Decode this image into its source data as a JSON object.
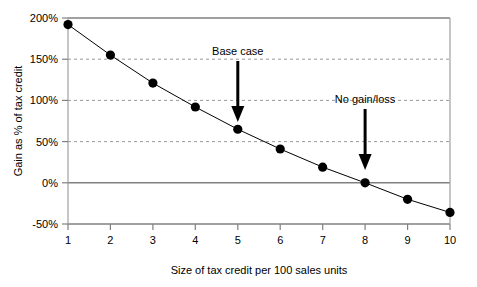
{
  "chart_data": {
    "type": "line",
    "title": "",
    "subtitle": "",
    "xlabel": "Size of tax credit per 100 sales units",
    "ylabel": "Gain as % of tax credit",
    "x": [
      1,
      2,
      3,
      4,
      5,
      6,
      7,
      8,
      9,
      10
    ],
    "values": [
      192,
      155,
      121,
      92,
      65,
      41,
      19,
      0,
      -20,
      -36
    ],
    "series": [
      {
        "name": "Gain as % of tax credit",
        "values": [
          192,
          155,
          121,
          92,
          65,
          41,
          19,
          0,
          -20,
          -36
        ],
        "marker": "filled-circle",
        "color": "#000000"
      }
    ],
    "xlim": [
      1,
      10
    ],
    "ylim": [
      -50,
      200
    ],
    "xticks": [
      1,
      2,
      3,
      4,
      5,
      6,
      7,
      8,
      9,
      10
    ],
    "xticklabels": [
      "1",
      "2",
      "3",
      "4",
      "5",
      "6",
      "7",
      "8",
      "9",
      "10"
    ],
    "yticks": [
      -50,
      0,
      50,
      100,
      150,
      200
    ],
    "yticklabels": [
      "-50%",
      "0%",
      "50%",
      "100%",
      "150%",
      "200%"
    ],
    "grid": "horizontal-dashed",
    "gridlines_at": [
      50,
      100,
      150
    ],
    "solid_lines_at": [
      -50,
      0,
      200
    ],
    "legend": "none",
    "annotations": [
      {
        "text": "Base case",
        "x": 5,
        "y": 65,
        "label_y": 170,
        "arrow": "down"
      },
      {
        "text": "No gain/loss",
        "x": 8,
        "y": 0,
        "label_y": 118,
        "arrow": "down"
      }
    ]
  },
  "colors": {
    "line": "#000000",
    "marker": "#000000",
    "axis": "#808080",
    "grid": "#999999",
    "text": "#000000",
    "background": "#ffffff"
  }
}
